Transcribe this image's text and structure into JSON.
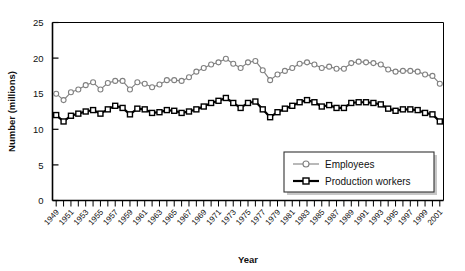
{
  "chart_data": {
    "type": "line",
    "title": "",
    "xlabel": "Year",
    "ylabel": "Number (millions)",
    "ylim": [
      0,
      25
    ],
    "yticks": [
      0,
      5,
      10,
      15,
      20,
      25
    ],
    "ytick_labels": [
      "0",
      "5",
      "10",
      "15",
      "20",
      "25"
    ],
    "grid": false,
    "legend_position": "bottom-right",
    "x": [
      1949,
      1950,
      1951,
      1952,
      1953,
      1954,
      1955,
      1956,
      1957,
      1958,
      1959,
      1960,
      1961,
      1962,
      1963,
      1964,
      1965,
      1966,
      1967,
      1968,
      1969,
      1970,
      1971,
      1972,
      1973,
      1974,
      1975,
      1976,
      1977,
      1978,
      1979,
      1980,
      1981,
      1982,
      1983,
      1984,
      1985,
      1986,
      1987,
      1988,
      1989,
      1990,
      1991,
      1992,
      1993,
      1994,
      1995,
      1996,
      1997,
      1998,
      1999,
      2000,
      2001
    ],
    "xtick_labels": [
      "1949",
      "1951",
      "1953",
      "1955",
      "1957",
      "1959",
      "1961",
      "1963",
      "1965",
      "1967",
      "1969",
      "1971",
      "1973",
      "1975",
      "1977",
      "1979",
      "1981",
      "1983",
      "1985",
      "1987",
      "1989",
      "1991",
      "1993",
      "1995",
      "1997",
      "1999",
      "2001"
    ],
    "series": [
      {
        "name": "Employees",
        "marker": "circle",
        "color": "#808080",
        "line_width": 1.1,
        "values": [
          15.0,
          14.1,
          15.2,
          15.6,
          16.2,
          16.6,
          15.6,
          16.5,
          16.8,
          16.8,
          15.6,
          16.6,
          16.4,
          15.9,
          16.3,
          16.9,
          16.9,
          16.8,
          17.3,
          18.1,
          18.6,
          19.1,
          19.4,
          19.9,
          19.2,
          18.6,
          19.4,
          19.6,
          18.3,
          16.9,
          17.7,
          18.2,
          18.6,
          19.2,
          19.4,
          19.1,
          18.6,
          18.8,
          18.5,
          18.5,
          19.3,
          19.5,
          19.4,
          19.3,
          19.1,
          18.4,
          18.1,
          18.2,
          18.2,
          18.1,
          17.7,
          17.5,
          16.4
        ]
      },
      {
        "name": "Production workers",
        "marker": "square",
        "color": "#000000",
        "line_width": 2.2,
        "values": [
          12.0,
          11.1,
          11.9,
          12.2,
          12.5,
          12.7,
          12.2,
          12.8,
          13.3,
          13.0,
          12.1,
          12.9,
          12.8,
          12.3,
          12.4,
          12.7,
          12.6,
          12.3,
          12.5,
          12.8,
          13.2,
          13.7,
          14.0,
          14.4,
          13.7,
          13.0,
          13.7,
          13.9,
          12.8,
          11.7,
          12.4,
          12.9,
          13.3,
          13.8,
          14.1,
          13.8,
          13.2,
          13.4,
          13.0,
          13.0,
          13.7,
          13.8,
          13.8,
          13.7,
          13.5,
          12.9,
          12.6,
          12.8,
          12.8,
          12.7,
          12.3,
          12.1,
          11.1
        ]
      }
    ]
  },
  "legend": {
    "entries": [
      {
        "label": "Employees"
      },
      {
        "label": "Production workers"
      }
    ]
  },
  "axes": {
    "y_title": "Number (millions)",
    "x_title": "Year"
  }
}
